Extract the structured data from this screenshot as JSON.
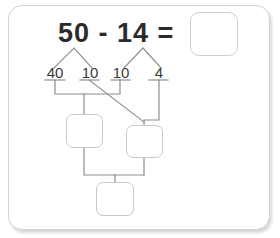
{
  "worksheet": {
    "type": "subtraction-decomposition-diagram",
    "equation": {
      "minuend": "50",
      "operator": "-",
      "subtrahend": "14",
      "equals": "=",
      "text": "50 - 14 ="
    },
    "answer_box": {
      "value": "",
      "label": "answer"
    },
    "decomposition": {
      "minuend_parts": [
        {
          "label": "40",
          "from": "50"
        },
        {
          "label": "10",
          "from": "50"
        }
      ],
      "subtrahend_parts": [
        {
          "label": "10",
          "from": "14"
        },
        {
          "label": "4",
          "from": "14"
        }
      ]
    },
    "partial_boxes": [
      {
        "name": "left-partial",
        "value": ""
      },
      {
        "name": "right-partial",
        "value": ""
      }
    ],
    "result_box": {
      "value": ""
    },
    "colors": {
      "card_border": "#d2d2d2",
      "box_border": "#c8c8c8",
      "line": "#8e8e8e",
      "text": "#2b2b2b",
      "number_text": "#3a3a3a",
      "background": "#ffffff"
    }
  }
}
